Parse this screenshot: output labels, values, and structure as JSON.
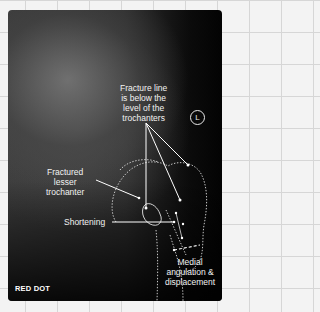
{
  "image": {
    "type": "radiograph",
    "side_marker": "L",
    "brand": "RED DOT",
    "annotations": [
      {
        "id": "fracture-line",
        "lines": [
          "Fracture line",
          "is below the",
          "level of the",
          "trochanters"
        ]
      },
      {
        "id": "lesser-trochanter",
        "lines": [
          "Fractured",
          "lesser",
          "trochanter"
        ]
      },
      {
        "id": "shortening",
        "lines": [
          "Shortening"
        ]
      },
      {
        "id": "medial-angulation",
        "lines": [
          "Medial",
          "angulation &",
          "displacement"
        ]
      }
    ]
  },
  "colors": {
    "annotation_text": "#f2f2f2",
    "line": "#ffffff",
    "page_background": "#f3f3f3",
    "grid": "#d6d6d6"
  }
}
